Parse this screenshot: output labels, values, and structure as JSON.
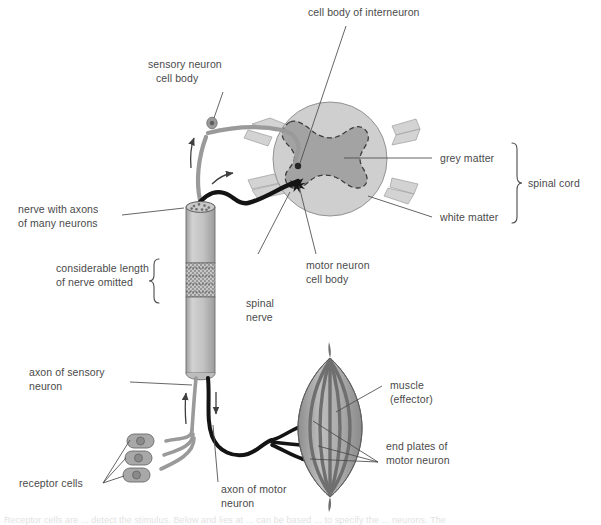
{
  "figure": {
    "top_partial_text": "",
    "bottom_partial_caption": "Receptor cells are ... detect the stimulus. Below and lies at ... can be based ... to specify the ... neurons. The"
  },
  "labels": {
    "cell_body_of_interneuron": "cell body of interneuron",
    "sensory_neuron_cell_body_l1": "sensory neuron",
    "sensory_neuron_cell_body_l2": "cell body",
    "grey_matter": "grey matter",
    "white_matter": "white matter",
    "spinal_cord": "spinal cord",
    "nerve_with_axons_l1": "nerve with axons",
    "nerve_with_axons_l2": "of many neurons",
    "considerable_length_l1": "considerable length",
    "considerable_length_l2": "of nerve omitted",
    "spinal_nerve_l1": "spinal",
    "spinal_nerve_l2": "nerve",
    "motor_neuron_cell_body_l1": "motor neuron",
    "motor_neuron_cell_body_l2": "cell body",
    "axon_of_sensory_neuron_l1": "axon of sensory",
    "axon_of_sensory_neuron_l2": "neuron",
    "receptor_cells": "receptor cells",
    "axon_of_motor_neuron_l1": "axon of motor",
    "axon_of_motor_neuron_l2": "neuron",
    "muscle_l1": "muscle",
    "muscle_l2": "(effector)",
    "end_plates_l1": "end plates of",
    "end_plates_l2": "motor neuron"
  },
  "colors": {
    "white_matter": "#cfcfcf",
    "grey_matter": "#a3a3a3",
    "cord_outline": "#7a7a7a",
    "nerve_body": "#bdbdbd",
    "nerve_outline": "#6e6e6e",
    "sensory_neuron": "#9a9a9a",
    "motor_neuron": "#141414",
    "muscle_light": "#b2b2b2",
    "muscle_dark": "#6f6f6f",
    "receptor_cell": "#a8a8a8",
    "leader_line": "#4a4a4a",
    "text": "#4a4a4a",
    "background": "#ffffff"
  },
  "structures": {
    "spinal_cord_circle": "cross-section of spinal cord shown as a pale grey disc",
    "grey_matter_shape": "butterfly/H-shaped darker grey region with dashed outline",
    "nerve_bundle": "vertical cylinder with cut-break hatching marking omitted length",
    "muscle_shape": "spindle-shaped striated effector muscle",
    "receptor_cells_count": 3,
    "end_plates_count": 3,
    "direction_arrows": 4
  }
}
